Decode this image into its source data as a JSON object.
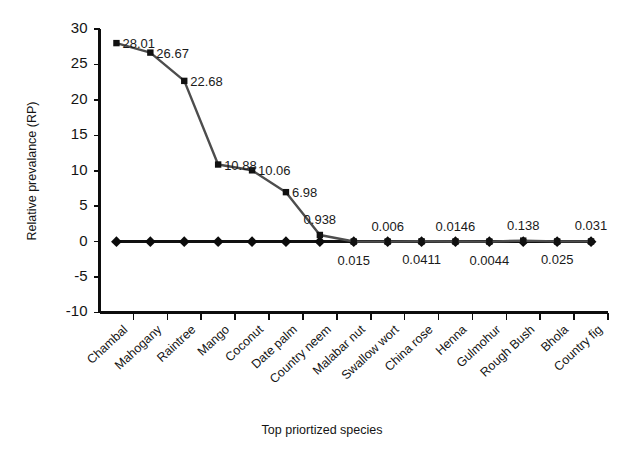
{
  "chart_data": {
    "type": "line",
    "title": "",
    "xlabel": "Top priortized species",
    "ylabel": "Relative prevalance (RP)",
    "ylim": [
      -10,
      30
    ],
    "yticks": [
      30,
      25,
      20,
      15,
      10,
      5,
      0,
      -5,
      -10
    ],
    "ytick_labels": [
      "30",
      "25",
      "20",
      "15",
      "10",
      "5",
      "0",
      "-5",
      "-10"
    ],
    "grid": false,
    "legend": "none",
    "categories": [
      "Chambal",
      "Mahogany",
      "Raintree",
      "Mango",
      "Coconut",
      "Date palm",
      "Country neem",
      "Malabar nut",
      "Swallow wort",
      "China rose",
      "Henna",
      "Gulmohur",
      "Rough Bush",
      "Bhola",
      "Country fig"
    ],
    "series": [
      {
        "name": "Relative prevalance",
        "marker": "square",
        "color": "#4d4d4d",
        "values": [
          28.01,
          26.67,
          22.68,
          10.88,
          10.06,
          6.98,
          0.938,
          0.015,
          0.006,
          0.0411,
          0.0146,
          0.0044,
          0.138,
          0.025,
          0.031
        ],
        "point_labels": [
          {
            "text": "28.01",
            "value": 28.01,
            "position": "right"
          },
          {
            "text": "26.67",
            "value": 26.67,
            "position": "right"
          },
          {
            "text": "22.68",
            "value": 22.68,
            "position": "right"
          },
          {
            "text": "10.88",
            "value": 10.88,
            "position": "right"
          },
          {
            "text": "10.06",
            "value": 10.06,
            "position": "right"
          },
          {
            "text": "6.98",
            "value": 6.98,
            "position": "right"
          },
          {
            "text": "0.938",
            "value": 0.938,
            "position": "above"
          },
          {
            "text": "0.015",
            "value": 0.015,
            "position": "below"
          },
          {
            "text": "0.006",
            "value": 0.006,
            "position": "above"
          },
          {
            "text": "0.0411",
            "value": 0.0411,
            "position": "below"
          },
          {
            "text": "0.0146",
            "value": 0.0146,
            "position": "above"
          },
          {
            "text": "0.0044",
            "value": 0.0044,
            "position": "below"
          },
          {
            "text": "0.138",
            "value": 0.138,
            "position": "above"
          },
          {
            "text": "0.025",
            "value": 0.025,
            "position": "below"
          },
          {
            "text": "0.031",
            "value": 0.031,
            "position": "above"
          }
        ]
      },
      {
        "name": "Baseline",
        "marker": "diamond",
        "color": "#111111",
        "values": [
          0,
          0,
          0,
          0,
          0,
          0,
          0,
          0,
          0,
          0,
          0,
          0,
          0,
          0,
          0
        ]
      }
    ]
  },
  "axis": {
    "y_title": "Relative prevalance (RP)",
    "x_title": "Top priortized species"
  }
}
